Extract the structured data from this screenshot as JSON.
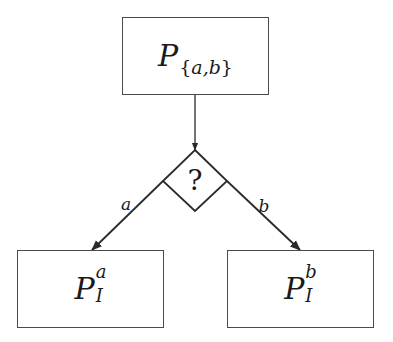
{
  "diagram": {
    "type": "decision-flow",
    "stroke_color": "#2a2a2a",
    "box_border_color": "#4a4a4a",
    "background": "#ffffff",
    "nodes": {
      "root": {
        "label_base": "P",
        "label_sub": "{a,b}",
        "sub_open": "{",
        "sub_content": "a,b",
        "sub_close": "}",
        "x": 122,
        "y": 17,
        "w": 147,
        "h": 78
      },
      "decision": {
        "label": "?",
        "cx": 195,
        "top": 150,
        "left": 163,
        "right": 227,
        "bottom": 211,
        "cy": 181
      },
      "left": {
        "label_base": "P",
        "label_sup": "a",
        "label_sub": "I",
        "x": 17,
        "y": 250,
        "w": 147,
        "h": 78
      },
      "right": {
        "label_base": "P",
        "label_sup": "b",
        "label_sub": "I",
        "x": 227,
        "y": 250,
        "w": 147,
        "h": 78
      }
    },
    "edges": [
      {
        "from": "root",
        "to": "decision",
        "label": "",
        "x1": 195,
        "y1": 95,
        "x2": 195,
        "y2": 150
      },
      {
        "from": "decision",
        "to": "left",
        "label": "a",
        "x1": 163,
        "y1": 181,
        "x2": 92,
        "y2": 250,
        "label_x": 126,
        "label_y": 204
      },
      {
        "from": "decision",
        "to": "right",
        "label": "b",
        "x1": 227,
        "y1": 181,
        "x2": 300,
        "y2": 250,
        "label_x": 264,
        "label_y": 206
      }
    ]
  }
}
